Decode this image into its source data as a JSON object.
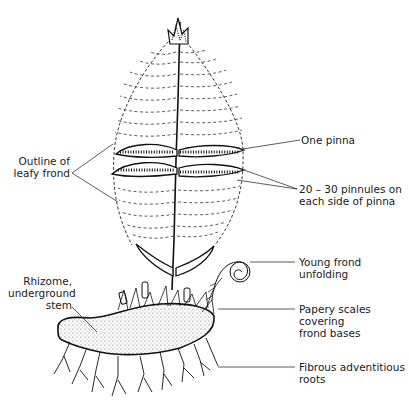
{
  "figure": {
    "labels": {
      "outline": "Outline of\nleafy frond",
      "pinna": "One pinna",
      "pinnules": "20 – 30 pinnules on\neach side of pinna",
      "young_frond": "Young frond\nunfolding",
      "scales": "Papery scales\ncovering\nfrond bases",
      "roots": "Fibrous adventitious\nroots",
      "rhizome": "Rhizome,\nunderground\nstem"
    },
    "colors": {
      "ink": "#1a1a1a",
      "background": "#ffffff"
    }
  }
}
